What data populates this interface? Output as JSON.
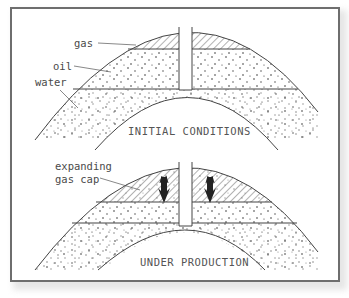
{
  "figure": {
    "panels": [
      {
        "id": "initial",
        "caption": "INITIAL CONDITIONS",
        "labels": {
          "gas": "gas",
          "oil": "oil",
          "water": "water"
        }
      },
      {
        "id": "production",
        "caption": "UNDER PRODUCTION",
        "labels": {
          "gas_cap_line1": "expanding",
          "gas_cap_line2": "gas cap"
        }
      }
    ],
    "colors": {
      "frame": "#6e6e6e",
      "line": "#444444",
      "text": "#4a4a4a",
      "hatch": "#555555",
      "arrow": "#222222"
    }
  }
}
